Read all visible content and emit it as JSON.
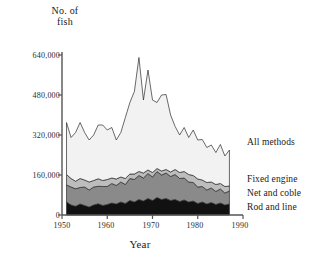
{
  "chart_data": {
    "type": "area",
    "title": "No. of fish",
    "xlabel": "Year",
    "ylabel": "No. of fish",
    "stacked": true,
    "grid": false,
    "legend_position": "right",
    "xlim": [
      1950,
      1990
    ],
    "ylim": [
      0,
      640000
    ],
    "xticks": [
      "1950",
      "1960",
      "1970",
      "1980",
      "1990"
    ],
    "yticks": [
      "0",
      "160,000",
      "320,000",
      "480,000",
      "640,000"
    ],
    "x": [
      1951,
      1952,
      1953,
      1954,
      1955,
      1956,
      1957,
      1958,
      1959,
      1960,
      1961,
      1962,
      1963,
      1964,
      1965,
      1966,
      1967,
      1968,
      1969,
      1970,
      1971,
      1972,
      1973,
      1974,
      1975,
      1976,
      1977,
      1978,
      1979,
      1980,
      1981,
      1982,
      1983,
      1984,
      1985,
      1986,
      1987
    ],
    "categories": [
      "1951",
      "1952",
      "1953",
      "1954",
      "1955",
      "1956",
      "1957",
      "1958",
      "1959",
      "1960",
      "1961",
      "1962",
      "1963",
      "1964",
      "1965",
      "1966",
      "1967",
      "1968",
      "1969",
      "1970",
      "1971",
      "1972",
      "1973",
      "1974",
      "1975",
      "1976",
      "1977",
      "1978",
      "1979",
      "1980",
      "1981",
      "1982",
      "1983",
      "1984",
      "1985",
      "1986",
      "1987"
    ],
    "series": [
      {
        "name": "Rod and line",
        "color": "#111111",
        "values": [
          52000,
          40000,
          35000,
          44000,
          38000,
          32000,
          40000,
          45000,
          38000,
          42000,
          48000,
          44000,
          52000,
          46000,
          58000,
          52000,
          62000,
          56000,
          66000,
          58000,
          70000,
          62000,
          66000,
          58000,
          62000,
          54000,
          60000,
          52000,
          56000,
          46000,
          52000,
          44000,
          50000,
          42000,
          48000,
          40000,
          44000
        ]
      },
      {
        "name": "Net and coble",
        "color": "#8a8a8a",
        "values": [
          68000,
          72000,
          70000,
          66000,
          74000,
          68000,
          72000,
          70000,
          76000,
          72000,
          78000,
          74000,
          80000,
          76000,
          88000,
          90000,
          96000,
          92000,
          100000,
          94000,
          104000,
          98000,
          102000,
          96000,
          100000,
          92000,
          88000,
          80000,
          74000,
          66000,
          62000,
          56000,
          58000,
          52000,
          56000,
          48000,
          52000
        ]
      },
      {
        "name": "Fixed engine",
        "color": "#bdbdbd",
        "values": [
          42000,
          34000,
          30000,
          36000,
          28000,
          32000,
          26000,
          30000,
          24000,
          28000,
          22000,
          26000,
          20000,
          24000,
          18000,
          22000,
          16000,
          20000,
          14000,
          18000,
          12000,
          16000,
          14000,
          18000,
          20000,
          24000,
          26000,
          30000,
          28000,
          32000,
          26000,
          30000,
          24000,
          28000,
          22000,
          26000,
          20000
        ]
      },
      {
        "name": "All methods",
        "color": "#f2f2f2",
        "values": [
          208000,
          164000,
          195000,
          224000,
          190000,
          168000,
          182000,
          215000,
          222000,
          198000,
          202000,
          156000,
          178000,
          244000,
          286000,
          330000,
          456000,
          292000,
          400000,
          290000,
          264000,
          304000,
          300000,
          228000,
          172000,
          150000,
          176000,
          148000,
          182000,
          156000,
          162000,
          140000,
          148000,
          128000,
          156000,
          122000,
          144000
        ]
      }
    ],
    "totals": [
      370000,
      310000,
      330000,
      370000,
      330000,
      300000,
      320000,
      360000,
      360000,
      340000,
      350000,
      300000,
      330000,
      390000,
      450000,
      494000,
      630000,
      460000,
      580000,
      460000,
      450000,
      480000,
      482000,
      400000,
      354000,
      320000,
      350000,
      310000,
      340000,
      300000,
      302000,
      270000,
      280000,
      250000,
      282000,
      236000,
      260000
    ],
    "legend": [
      {
        "label": "All methods",
        "color": "#f2f2f2"
      },
      {
        "label": "Fixed engine",
        "color": "#bdbdbd"
      },
      {
        "label": "Net and coble",
        "color": "#8a8a8a"
      },
      {
        "label": "Rod and line",
        "color": "#111111"
      }
    ]
  },
  "axis": {
    "y_title_line1": "No. of",
    "y_title_line2": "fish",
    "x_title": "Year"
  }
}
